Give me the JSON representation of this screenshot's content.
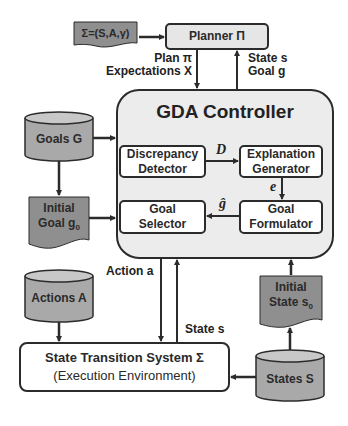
{
  "diagram": {
    "colors": {
      "stroke": "#2b2b2b",
      "controller_fill": "#ececec",
      "planner_fill": "#e6e6e6",
      "document_fill": "#8f8f8f",
      "cylinder_fill": "#a9a9a9",
      "cylinder_top": "#c8c8c8",
      "inner_box_fill": "#ffffff"
    },
    "nodes": {
      "sigma_def": "Σ=(S,A,γ)",
      "planner": "Planner Π",
      "controller": "GDA Controller",
      "discrepancy_detector": [
        "Discrepancy",
        "Detector"
      ],
      "explanation_generator": [
        "Explanation",
        "Generator"
      ],
      "goal_selector": [
        "Goal",
        "Selector"
      ],
      "goal_formulator": [
        "Goal",
        "Formulator"
      ],
      "goals": "Goals G",
      "initial_goal": [
        "Initial",
        "Goal g",
        "0"
      ],
      "actions": "Actions A",
      "initial_state": [
        "Initial",
        "State s",
        "0"
      ],
      "states": "States S",
      "state_transition_system": [
        "State Transition System Σ",
        "(Execution Environment)"
      ]
    },
    "edges": {
      "plan_label": [
        "Plan π",
        "Expectations X"
      ],
      "state_goal_label": [
        "State s",
        "Goal g"
      ],
      "d_label": "D",
      "e_label": "e",
      "ghat_label": "ĝ",
      "action_label": "Action a",
      "state_label": "State s"
    }
  }
}
